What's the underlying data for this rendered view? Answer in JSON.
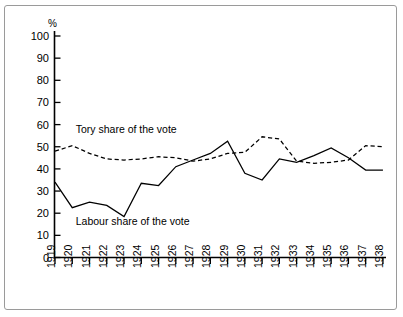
{
  "chart_data": {
    "type": "line",
    "title": "",
    "xlabel": "",
    "ylabel": "%",
    "ylim": [
      0,
      100
    ],
    "yticks": [
      0,
      10,
      20,
      30,
      40,
      50,
      60,
      70,
      80,
      90,
      100
    ],
    "grid": false,
    "legend_position": "inline-annotation",
    "x": [
      1919,
      1920,
      1921,
      1922,
      1923,
      1924,
      1925,
      1926,
      1927,
      1928,
      1929,
      1930,
      1931,
      1932,
      1933,
      1934,
      1935,
      1936,
      1937,
      1938
    ],
    "categories": [
      "1919",
      "1920",
      "1921",
      "1922",
      "1923",
      "1924",
      "1925",
      "1926",
      "1927",
      "1928",
      "1929",
      "1930",
      "1931",
      "1932",
      "1933",
      "1934",
      "1935",
      "1936",
      "1937",
      "1938"
    ],
    "series": [
      {
        "name": "Tory share of the vote",
        "style": "dashed",
        "color": "#000000",
        "values": [
          48,
          50.5,
          47,
          44.5,
          44,
          44.5,
          45.5,
          45,
          43.5,
          44.5,
          47,
          47.5,
          54.5,
          53.5,
          43.5,
          42.5,
          43,
          44,
          50.5,
          50
        ]
      },
      {
        "name": "Labour share of the vote",
        "style": "solid",
        "color": "#000000",
        "values": [
          34,
          22.5,
          25,
          23.5,
          18.5,
          33.5,
          32.5,
          41,
          44,
          47,
          52.5,
          38,
          35,
          44.5,
          43,
          46,
          49.5,
          45,
          39.5,
          39.5
        ]
      }
    ],
    "annotations": [
      {
        "text": "Tory share of the vote",
        "x_year": 1920.2,
        "y_value": 56
      },
      {
        "text": "Labour share of the vote",
        "x_year": 1920.2,
        "y_value": 14.5
      }
    ]
  },
  "axis": {
    "y_unit": "%",
    "y_ticks": [
      "100",
      "90",
      "80",
      "70",
      "60",
      "50",
      "40",
      "30",
      "20",
      "10",
      "0"
    ],
    "x_ticks": [
      "1919",
      "1920",
      "1921",
      "1922",
      "1923",
      "1924",
      "1925",
      "1926",
      "1927",
      "1928",
      "1929",
      "1930",
      "1931",
      "1932",
      "1933",
      "1934",
      "1935",
      "1936",
      "1937",
      "1938"
    ]
  }
}
